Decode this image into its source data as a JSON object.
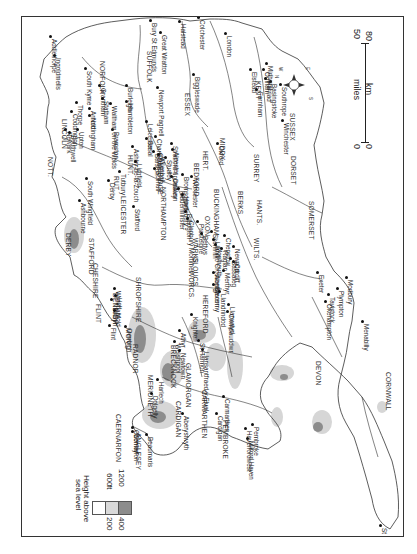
{
  "map": {
    "orientation_note": "Map rotated 90° clockwise; north points left",
    "counties": [
      {
        "name": "NORFOLK",
        "x": 104,
        "y": 60
      },
      {
        "name": "SUFFOLK",
        "x": 151,
        "y": 50
      },
      {
        "name": "ESSEX",
        "x": 189,
        "y": 92
      },
      {
        "name": "KENT",
        "x": 260,
        "y": 80
      },
      {
        "name": "SUSSEX",
        "x": 294,
        "y": 112
      },
      {
        "name": "LINCOLN",
        "x": 66,
        "y": 118
      },
      {
        "name": "CAMBRIDGE",
        "x": 162,
        "y": 152
      },
      {
        "name": "HUNT.",
        "x": 132,
        "y": 154
      },
      {
        "name": "HERT.",
        "x": 207,
        "y": 150
      },
      {
        "name": "MIDDX.",
        "x": 224,
        "y": 137
      },
      {
        "name": "SURREY",
        "x": 258,
        "y": 153
      },
      {
        "name": "BEDFORD",
        "x": 198,
        "y": 162
      },
      {
        "name": "BUCKINGHAM",
        "x": 218,
        "y": 188
      },
      {
        "name": "NORTHAMPTON",
        "x": 165,
        "y": 186
      },
      {
        "name": "RUT.",
        "x": 118,
        "y": 175
      },
      {
        "name": "LEICESTER",
        "x": 125,
        "y": 195
      },
      {
        "name": "NOTT.",
        "x": 52,
        "y": 156
      },
      {
        "name": "DERBY",
        "x": 70,
        "y": 232
      },
      {
        "name": "STAFFORD",
        "x": 93,
        "y": 237
      },
      {
        "name": "CHESHIRE",
        "x": 97,
        "y": 262
      },
      {
        "name": "WARKS.",
        "x": 197,
        "y": 237
      },
      {
        "name": "OXON.",
        "x": 209,
        "y": 215
      },
      {
        "name": "BERKS.",
        "x": 242,
        "y": 190
      },
      {
        "name": "HANTS.",
        "x": 261,
        "y": 199
      },
      {
        "name": "WILTS.",
        "x": 258,
        "y": 237
      },
      {
        "name": "GLOUCS.",
        "x": 197,
        "y": 256
      },
      {
        "name": "WORCS.",
        "x": 193,
        "y": 270
      },
      {
        "name": "HEREFORD",
        "x": 207,
        "y": 294
      },
      {
        "name": "SHROPSHIRE",
        "x": 140,
        "y": 276
      },
      {
        "name": "DORSET",
        "x": 295,
        "y": 155
      },
      {
        "name": "SOMERSET",
        "x": 313,
        "y": 200
      },
      {
        "name": "DEVON",
        "x": 320,
        "y": 360
      },
      {
        "name": "CORNWALL",
        "x": 390,
        "y": 371
      },
      {
        "name": "FLINT",
        "x": 100,
        "y": 303
      },
      {
        "name": "DENBIGH",
        "x": 117,
        "y": 292
      },
      {
        "name": "MONT.",
        "x": 130,
        "y": 327
      },
      {
        "name": "MERIONETH",
        "x": 152,
        "y": 374
      },
      {
        "name": "CAERNARFON",
        "x": 120,
        "y": 413
      },
      {
        "name": "ANGLESEY",
        "x": 140,
        "y": 432
      },
      {
        "name": "RADNOR",
        "x": 137,
        "y": 343
      },
      {
        "name": "BRECKNOCK",
        "x": 175,
        "y": 344
      },
      {
        "name": "GLAMORGAN",
        "x": 190,
        "y": 362
      },
      {
        "name": "CARDIGAN",
        "x": 180,
        "y": 400
      },
      {
        "name": "CARMARTHEN",
        "x": 206,
        "y": 389
      },
      {
        "name": "PEMBROKE",
        "x": 227,
        "y": 419
      }
    ],
    "towns": [
      {
        "name": "Addlethorpe",
        "x": 49,
        "y": 35
      },
      {
        "name": "Ingoldmells",
        "x": 53,
        "y": 54
      },
      {
        "name": "South Kyme",
        "x": 84,
        "y": 67
      },
      {
        "name": "Grantham",
        "x": 98,
        "y": 84
      },
      {
        "name": "Coddington",
        "x": 70,
        "y": 110
      },
      {
        "name": "Newark",
        "x": 64,
        "y": 128
      },
      {
        "name": "Thorpe",
        "x": 75,
        "y": 101
      },
      {
        "name": "Upton",
        "x": 76,
        "y": 128
      },
      {
        "name": "Southwell",
        "x": 68,
        "y": 131
      },
      {
        "name": "Arnold",
        "x": 88,
        "y": 107
      },
      {
        "name": "Nottingham",
        "x": 88,
        "y": 114
      },
      {
        "name": "Statham",
        "x": 101,
        "y": 97
      },
      {
        "name": "Bramston",
        "x": 111,
        "y": 128
      },
      {
        "name": "Waltham on the Wolds",
        "x": 109,
        "y": 102
      },
      {
        "name": "Burleigh",
        "x": 125,
        "y": 84
      },
      {
        "name": "Hambleton",
        "x": 125,
        "y": 100
      },
      {
        "name": "Leicester",
        "x": 145,
        "y": 120
      },
      {
        "name": "Ashby-de-la-Zouch",
        "x": 131,
        "y": 145
      },
      {
        "name": "Basal",
        "x": 145,
        "y": 137
      },
      {
        "name": "Barston",
        "x": 152,
        "y": 150
      },
      {
        "name": "Charlecote",
        "x": 154,
        "y": 135
      },
      {
        "name": "Stratford upon Avon",
        "x": 170,
        "y": 142
      },
      {
        "name": "Wilenhall",
        "x": 157,
        "y": 153
      },
      {
        "name": "Studley",
        "x": 164,
        "y": 156
      },
      {
        "name": "Alcester",
        "x": 171,
        "y": 148
      },
      {
        "name": "Solihull",
        "x": 153,
        "y": 167
      },
      {
        "name": "Dudley",
        "x": 170,
        "y": 175
      },
      {
        "name": "Lichfield",
        "x": 134,
        "y": 160
      },
      {
        "name": "Tutbury",
        "x": 118,
        "y": 170
      },
      {
        "name": "Derby",
        "x": 107,
        "y": 179
      },
      {
        "name": "South Wingfield",
        "x": 85,
        "y": 177
      },
      {
        "name": "Ashbourne",
        "x": 78,
        "y": 199
      },
      {
        "name": "Stafford",
        "x": 132,
        "y": 205
      },
      {
        "name": "Newport Pagnell",
        "x": 156,
        "y": 86
      },
      {
        "name": "Bury St Edmunds",
        "x": 149,
        "y": 19
      },
      {
        "name": "Great Wratton",
        "x": 159,
        "y": 31
      },
      {
        "name": "Halstead",
        "x": 178,
        "y": 20
      },
      {
        "name": "Colchester",
        "x": 197,
        "y": 16
      },
      {
        "name": "Biggleswade",
        "x": 192,
        "y": 73
      },
      {
        "name": "London",
        "x": 224,
        "y": 32
      },
      {
        "name": "Oxford",
        "x": 216,
        "y": 142
      },
      {
        "name": "Odiham",
        "x": 262,
        "y": 68
      },
      {
        "name": "Basingstoke",
        "x": 269,
        "y": 80
      },
      {
        "name": "Harriad",
        "x": 264,
        "y": 77
      },
      {
        "name": "Farnham",
        "x": 255,
        "y": 88
      },
      {
        "name": "Elstead",
        "x": 249,
        "y": 68
      },
      {
        "name": "Midhurst",
        "x": 265,
        "y": 62
      },
      {
        "name": "Southrope",
        "x": 279,
        "y": 83
      },
      {
        "name": "Winchester",
        "x": 281,
        "y": 119
      },
      {
        "name": "Kidderminster",
        "x": 177,
        "y": 187
      },
      {
        "name": "Hartlebury",
        "x": 181,
        "y": 193
      },
      {
        "name": "Worcester",
        "x": 190,
        "y": 175
      },
      {
        "name": "Bromsgrove",
        "x": 181,
        "y": 173
      },
      {
        "name": "Billington",
        "x": 184,
        "y": 210
      },
      {
        "name": "Cleobury Mortimer",
        "x": 186,
        "y": 217
      },
      {
        "name": "Presteigne",
        "x": 196,
        "y": 220
      },
      {
        "name": "Bettws",
        "x": 200,
        "y": 232
      },
      {
        "name": "Skenfrith",
        "x": 210,
        "y": 230
      },
      {
        "name": "Llanfilo Crossenny",
        "x": 212,
        "y": 238
      },
      {
        "name": "Monmouth",
        "x": 214,
        "y": 243
      },
      {
        "name": "Raglan",
        "x": 220,
        "y": 247
      },
      {
        "name": "Chepstow",
        "x": 223,
        "y": 234
      },
      {
        "name": "Newport",
        "x": 232,
        "y": 245
      },
      {
        "name": "Cardiff",
        "x": 232,
        "y": 260
      },
      {
        "name": "Bassaleg",
        "x": 229,
        "y": 257
      },
      {
        "name": "Merthyr",
        "x": 222,
        "y": 269
      },
      {
        "name": "Brecon",
        "x": 212,
        "y": 283
      },
      {
        "name": "Abergavenny",
        "x": 212,
        "y": 271
      },
      {
        "name": "Llandrindod",
        "x": 218,
        "y": 290
      },
      {
        "name": "Llanwrtyd",
        "x": 227,
        "y": 303
      },
      {
        "name": "Cwmdauddwr",
        "x": 226,
        "y": 310
      },
      {
        "name": "Athyr",
        "x": 178,
        "y": 329
      },
      {
        "name": "Welshpool",
        "x": 173,
        "y": 340
      },
      {
        "name": "Newtown",
        "x": 178,
        "y": 349
      },
      {
        "name": "Knighton",
        "x": 190,
        "y": 313
      },
      {
        "name": "St Harmon",
        "x": 197,
        "y": 339
      },
      {
        "name": "Llansantfraed-y-Elvel",
        "x": 201,
        "y": 348
      },
      {
        "name": "Wrexham",
        "x": 113,
        "y": 287
      },
      {
        "name": "Holt",
        "x": 114,
        "y": 294
      },
      {
        "name": "Trevalyn",
        "x": 110,
        "y": 298
      },
      {
        "name": "Mold",
        "x": 113,
        "y": 309
      },
      {
        "name": "Flint",
        "x": 108,
        "y": 324
      },
      {
        "name": "Denbigh",
        "x": 124,
        "y": 325
      },
      {
        "name": "Harlech",
        "x": 156,
        "y": 378
      },
      {
        "name": "Dolgelly",
        "x": 150,
        "y": 392
      },
      {
        "name": "Conwy",
        "x": 131,
        "y": 430
      },
      {
        "name": "Caernarfon",
        "x": 131,
        "y": 426
      },
      {
        "name": "Beaumaris",
        "x": 145,
        "y": 433
      },
      {
        "name": "Aberystwyth",
        "x": 181,
        "y": 412
      },
      {
        "name": "Cardigan",
        "x": 215,
        "y": 412
      },
      {
        "name": "Carmarthen",
        "x": 222,
        "y": 395
      },
      {
        "name": "Haverfordwest",
        "x": 244,
        "y": 427
      },
      {
        "name": "Milford Haven",
        "x": 246,
        "y": 437
      },
      {
        "name": "Pembroke",
        "x": 251,
        "y": 423
      },
      {
        "name": "Exeter",
        "x": 316,
        "y": 271
      },
      {
        "name": "Okehampton",
        "x": 324,
        "y": 300
      },
      {
        "name": "Tavistock",
        "x": 327,
        "y": 293
      },
      {
        "name": "Plympton",
        "x": 336,
        "y": 287
      },
      {
        "name": "Modbury",
        "x": 345,
        "y": 276
      },
      {
        "name": "Menabilly",
        "x": 361,
        "y": 320
      },
      {
        "name": "St Michael's Mount",
        "x": 379,
        "y": 524
      }
    ],
    "compass": {
      "n": "N",
      "e": "E",
      "s": "S",
      "w": "W"
    },
    "scale": {
      "miles_label": "miles",
      "km_label": "km",
      "miles_0": "0",
      "miles_50": "50",
      "km_0": "0",
      "km_80": "80"
    },
    "legend": {
      "title_line1": "Height above",
      "title_line2": "sea level",
      "ft_label": "ft",
      "m_label": "m",
      "bands": [
        {
          "ft": "",
          "m": "",
          "color": "#ffffff"
        },
        {
          "ft": "600",
          "m": "200",
          "color": "#d9d9d9"
        },
        {
          "ft": "1200",
          "m": "400",
          "color": "#8c8c8c"
        }
      ]
    }
  }
}
